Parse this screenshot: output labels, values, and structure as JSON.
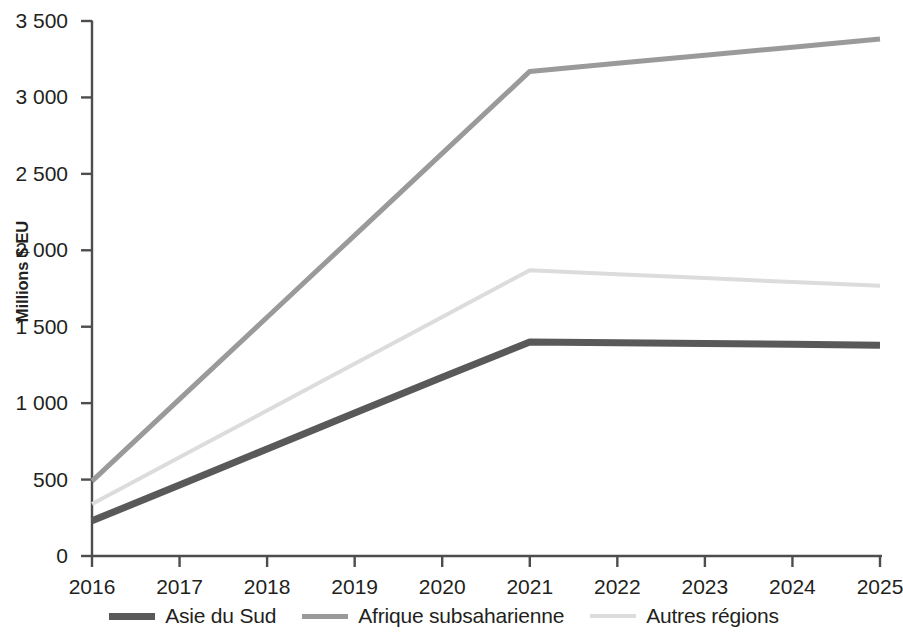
{
  "chart_data": {
    "type": "line",
    "title": "",
    "subtitle": "",
    "xlabel": "",
    "ylabel": "Millions $ EU",
    "x": [
      2016,
      2017,
      2018,
      2019,
      2020,
      2021,
      2022,
      2023,
      2024,
      2025
    ],
    "xtick_labels": [
      "2016",
      "2017",
      "2018",
      "2019",
      "2020",
      "2021",
      "2022",
      "2023",
      "2024",
      "2025"
    ],
    "ytick_values": [
      0,
      500,
      1000,
      1500,
      2000,
      2500,
      3000,
      3500
    ],
    "ytick_labels": [
      "0",
      "500",
      "1 000",
      "1 500",
      "2 000",
      "2 500",
      "3 000",
      "3 500"
    ],
    "ylim": [
      0,
      3500
    ],
    "xlim": [
      2016,
      2025
    ],
    "grid": false,
    "legend_position": "bottom",
    "series": [
      {
        "name": "Asie du Sud",
        "color": "#595959",
        "width": 7,
        "values": [
          230,
          465,
          700,
          935,
          1170,
          1400,
          1395,
          1390,
          1385,
          1378
        ]
      },
      {
        "name": "Afrique subsaharienne",
        "color": "#9a9a9a",
        "width": 5,
        "values": [
          490,
          1026,
          1562,
          2098,
          2634,
          3170,
          3223,
          3276,
          3329,
          3382
        ]
      },
      {
        "name": "Autres régions",
        "color": "#dcdcdc",
        "width": 4,
        "values": [
          340,
          646,
          952,
          1258,
          1564,
          1870,
          1844,
          1818,
          1792,
          1768
        ]
      }
    ]
  },
  "axis": {
    "line_color": "#4d4d4d"
  },
  "legend": {
    "items": [
      {
        "label": "Asie du Sud"
      },
      {
        "label": "Afrique subsaharienne"
      },
      {
        "label": "Autres régions"
      }
    ]
  }
}
